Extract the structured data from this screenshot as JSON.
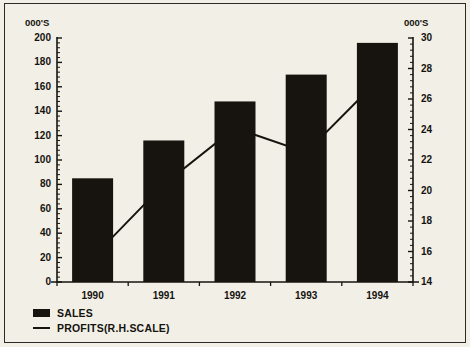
{
  "chart_data": {
    "type": "bar",
    "title": "",
    "subtitle": "",
    "xlabel": "",
    "ylabel": "000'S",
    "y2label": "000'S",
    "categories": [
      "1990",
      "1991",
      "1992",
      "1993",
      "1994"
    ],
    "grid": false,
    "legend_position": "bottom-left",
    "ylim": [
      0,
      200
    ],
    "yticks": [
      0,
      20,
      40,
      60,
      80,
      100,
      120,
      140,
      160,
      180,
      200
    ],
    "ytick_labels": [
      "0",
      "20",
      "40",
      "60",
      "80",
      "100",
      "120",
      "140",
      "160",
      "180",
      "200"
    ],
    "y2lim": [
      14,
      30
    ],
    "y2ticks": [
      14,
      16,
      18,
      20,
      22,
      24,
      26,
      28,
      30
    ],
    "y2tick_labels": [
      "14",
      "16",
      "18",
      "20",
      "22",
      "24",
      "26",
      "28",
      "30"
    ],
    "minor_ticks": true,
    "series": [
      {
        "name": "SALES",
        "type": "bar",
        "axis": "left",
        "color": "#17140f",
        "values": [
          85,
          116,
          148,
          170,
          196
        ]
      },
      {
        "name": "PROFITS(R.H.SCALE)",
        "type": "line",
        "axis": "right",
        "color": "#17140f",
        "values": [
          15.6,
          20.4,
          24.1,
          22.5,
          27.2
        ]
      }
    ]
  },
  "legend": {
    "items": [
      {
        "label": "SALES",
        "marker": "bar-swatch"
      },
      {
        "label": "PROFITS(R.H.SCALE)",
        "marker": "line-swatch"
      }
    ]
  },
  "axes": {
    "left_unit": "000'S",
    "right_unit": "000'S"
  }
}
